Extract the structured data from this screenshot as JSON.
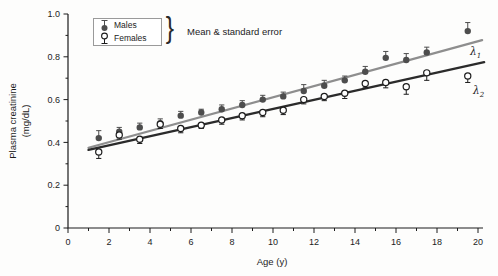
{
  "figure": {
    "legend": {
      "male_label": "Males",
      "female_label": "Females",
      "brace": "}",
      "note": "Mean & standard error"
    },
    "colors": {
      "male_marker": "#4d4d4d",
      "female_marker_stroke": "#1c1c1c",
      "lambda1_line": "#8e8e8e",
      "lambda2_line": "#2b2b2b",
      "axis": "#1c1c1c",
      "background": "#fdfdfc"
    }
  },
  "chart_data": {
    "type": "scatter",
    "title": "",
    "xlabel": "Age (y)",
    "ylabel_line1": "Plasma creatinine",
    "ylabel_line2": "(mg/dL)",
    "xlim": [
      0,
      20
    ],
    "ylim": [
      0,
      1.0
    ],
    "x_major_ticks": [
      0,
      2,
      4,
      6,
      8,
      10,
      12,
      14,
      16,
      18,
      20
    ],
    "x_tick_labels": [
      "0",
      "2",
      "4",
      "6",
      "8",
      "10",
      "12",
      "14",
      "16",
      "18",
      "20"
    ],
    "x_minor_ticks": [
      1,
      3,
      5,
      7,
      9,
      11,
      13,
      15,
      17,
      19
    ],
    "y_major_ticks": [
      0,
      0.2,
      0.4,
      0.6,
      0.8,
      1.0
    ],
    "y_tick_labels": [
      "0",
      "0.2",
      "0.4",
      "0.6",
      "0.8",
      "1.0"
    ],
    "y_minor_ticks": [
      0.1,
      0.3,
      0.5,
      0.7,
      0.9
    ],
    "grid": false,
    "legend_position": "upper-left",
    "legend_note": "Mean & standard error",
    "series": [
      {
        "name": "Males",
        "marker": "filled-circle",
        "error_direction": "up",
        "color": "#4d4d4d",
        "points": [
          {
            "age": 1.5,
            "value": 0.42,
            "se": 0.035
          },
          {
            "age": 2.5,
            "value": 0.45,
            "se": 0.02
          },
          {
            "age": 3.5,
            "value": 0.47,
            "se": 0.02
          },
          {
            "age": 4.5,
            "value": 0.49,
            "se": 0.02
          },
          {
            "age": 5.5,
            "value": 0.525,
            "se": 0.02
          },
          {
            "age": 6.5,
            "value": 0.54,
            "se": 0.015
          },
          {
            "age": 7.5,
            "value": 0.555,
            "se": 0.02
          },
          {
            "age": 8.5,
            "value": 0.575,
            "se": 0.02
          },
          {
            "age": 9.5,
            "value": 0.6,
            "se": 0.02
          },
          {
            "age": 10.5,
            "value": 0.615,
            "se": 0.02
          },
          {
            "age": 11.5,
            "value": 0.64,
            "se": 0.03
          },
          {
            "age": 12.5,
            "value": 0.665,
            "se": 0.025
          },
          {
            "age": 13.5,
            "value": 0.69,
            "se": 0.02
          },
          {
            "age": 14.5,
            "value": 0.73,
            "se": 0.025
          },
          {
            "age": 15.5,
            "value": 0.795,
            "se": 0.03
          },
          {
            "age": 16.5,
            "value": 0.785,
            "se": 0.03
          },
          {
            "age": 17.5,
            "value": 0.82,
            "se": 0.025
          },
          {
            "age": 19.5,
            "value": 0.92,
            "se": 0.04
          }
        ]
      },
      {
        "name": "Females",
        "marker": "open-circle",
        "error_direction": "down",
        "color": "#1c1c1c",
        "points": [
          {
            "age": 1.5,
            "value": 0.355,
            "se": 0.03
          },
          {
            "age": 2.5,
            "value": 0.435,
            "se": 0.02
          },
          {
            "age": 3.5,
            "value": 0.415,
            "se": 0.02
          },
          {
            "age": 4.5,
            "value": 0.485,
            "se": 0.02
          },
          {
            "age": 5.5,
            "value": 0.465,
            "se": 0.02
          },
          {
            "age": 6.5,
            "value": 0.48,
            "se": 0.015
          },
          {
            "age": 7.5,
            "value": 0.505,
            "se": 0.02
          },
          {
            "age": 8.5,
            "value": 0.525,
            "se": 0.02
          },
          {
            "age": 9.5,
            "value": 0.54,
            "se": 0.02
          },
          {
            "age": 10.5,
            "value": 0.55,
            "se": 0.02
          },
          {
            "age": 11.5,
            "value": 0.6,
            "se": 0.02
          },
          {
            "age": 12.5,
            "value": 0.615,
            "se": 0.02
          },
          {
            "age": 13.5,
            "value": 0.63,
            "se": 0.025
          },
          {
            "age": 14.5,
            "value": 0.675,
            "se": 0.02
          },
          {
            "age": 15.5,
            "value": 0.68,
            "se": 0.025
          },
          {
            "age": 16.5,
            "value": 0.66,
            "se": 0.035
          },
          {
            "age": 17.5,
            "value": 0.725,
            "se": 0.035
          },
          {
            "age": 19.5,
            "value": 0.71,
            "se": 0.03
          }
        ]
      }
    ],
    "fit_lines": [
      {
        "label_main": "λ",
        "label_sub": "1",
        "series": "Males",
        "color": "#8e8e8e",
        "x1": 1.0,
        "y1": 0.375,
        "x2": 20.2,
        "y2": 0.878
      },
      {
        "label_main": "λ",
        "label_sub": "2",
        "series": "Females",
        "color": "#2b2b2b",
        "x1": 1.0,
        "y1": 0.365,
        "x2": 20.3,
        "y2": 0.775
      }
    ]
  }
}
